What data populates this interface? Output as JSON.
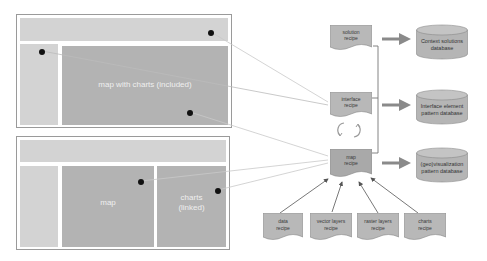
{
  "layouts": {
    "top": {
      "main_label": "map with charts (included)"
    },
    "bottom": {
      "map_label": "map",
      "charts_label_line1": "charts",
      "charts_label_line2": "(linked)"
    }
  },
  "recipes": {
    "solution": {
      "line1": "solution",
      "line2": "recipe"
    },
    "interface": {
      "line1": "interface",
      "line2": "recipe"
    },
    "map": {
      "line1": "map",
      "line2": "recipe"
    },
    "data": {
      "line1": "data",
      "line2": "recipe"
    },
    "vector": {
      "line1": "vector layers",
      "line2": "recipe"
    },
    "raster": {
      "line1": "raster layers",
      "line2": "recipe"
    },
    "charts": {
      "line1": "charts",
      "line2": "recipe"
    }
  },
  "databases": {
    "context": {
      "line1": "Context solutions",
      "line2": "database"
    },
    "interface": {
      "line1": "Interface element",
      "line2": "pattern database"
    },
    "visualization": {
      "line1": "(geo)visualization",
      "line2": "pattern database"
    }
  },
  "icons": {
    "cycle": "cycle-arrows-icon",
    "arrow": "right-arrow-icon"
  },
  "colors": {
    "pane_light": "#d3d3d3",
    "pane_mid": "#c4c4c4",
    "pane_dark": "#b3b3b3",
    "recipe_fill": "#b8b8b8",
    "db_fill": "#b5b5b5",
    "arrow": "#8a8a8a"
  }
}
